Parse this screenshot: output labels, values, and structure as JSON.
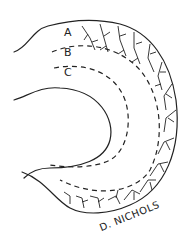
{
  "figure": {
    "labels": {
      "a": "A",
      "b": "B",
      "c": "C"
    },
    "signature": "D. NICHOLS",
    "colors": {
      "ink": "#222222",
      "background": "#ffffff"
    }
  }
}
